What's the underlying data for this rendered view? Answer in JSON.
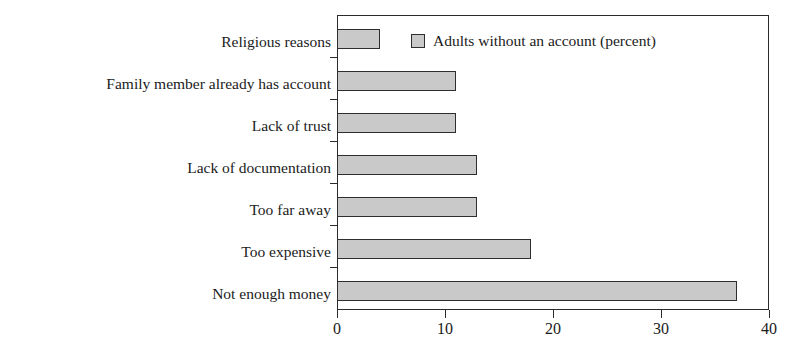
{
  "chart_data": {
    "type": "bar",
    "orientation": "horizontal",
    "title": "",
    "xlabel": "",
    "ylabel": "",
    "categories": [
      "Religious reasons",
      "Family member already has account",
      "Lack of  trust",
      "Lack of documentation",
      "Too far away",
      "Too expensive",
      "Not enough money"
    ],
    "values": [
      4,
      11,
      11,
      13,
      13,
      18,
      37
    ],
    "series": [
      {
        "name": "Adults without an account (percent)",
        "values": [
          4,
          11,
          11,
          13,
          13,
          18,
          37
        ]
      }
    ],
    "xlim": [
      0,
      40
    ],
    "xticks": [
      0,
      10,
      20,
      30,
      40
    ],
    "xtick_labels": [
      "0",
      "10",
      "20",
      "30",
      "40"
    ],
    "grid": false,
    "legend": {
      "position": "top-right-inside",
      "entries": [
        {
          "label": "Adults without an account (percent)",
          "color": "#c9c9c9"
        }
      ]
    },
    "colors": {
      "bar_fill": "#c9c9c9",
      "bar_border": "#2e2e2e",
      "axis": "#2b2b2b",
      "text": "#1b1b1b",
      "background": "#ffffff"
    }
  }
}
